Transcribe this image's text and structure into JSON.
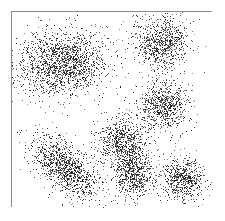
{
  "figure": {
    "title": "",
    "background_color": "#ffffff",
    "width": 225,
    "height": 221
  },
  "frame": {
    "name": "plot-border",
    "x": 11,
    "y": 11,
    "width": 201,
    "height": 196,
    "border_color": "#8a8a8a",
    "border_width": 1,
    "fill_color": "#ffffff"
  },
  "chart_data": {
    "type": "scatter",
    "title": "",
    "xlabel": "",
    "ylabel": "",
    "xlim": [
      0,
      225
    ],
    "ylim": [
      0,
      221
    ],
    "grid": false,
    "legend": null,
    "axis_ticks": false,
    "point_color": "#1a1a1a",
    "point_size": 1,
    "total_points": 6600,
    "clusters": [
      {
        "name": "top-left",
        "cx": 62,
        "cy": 62,
        "sx": 22,
        "sy": 17,
        "rotation_deg": -8,
        "n": 1700,
        "density": "very-high"
      },
      {
        "name": "top-right",
        "cx": 161,
        "cy": 42,
        "sx": 13,
        "sy": 13,
        "rotation_deg": 0,
        "n": 820,
        "density": "high"
      },
      {
        "name": "mid-right",
        "cx": 163,
        "cy": 105,
        "sx": 13,
        "sy": 13,
        "rotation_deg": 20,
        "n": 760,
        "density": "medium"
      },
      {
        "name": "bottom-left",
        "cx": 64,
        "cy": 166,
        "sx": 21,
        "sy": 11,
        "rotation_deg": 42,
        "n": 1150,
        "density": "high"
      },
      {
        "name": "bottom-center-upper",
        "cx": 122,
        "cy": 140,
        "sx": 12,
        "sy": 12,
        "rotation_deg": 35,
        "n": 700,
        "density": "medium"
      },
      {
        "name": "bottom-center-lower",
        "cx": 133,
        "cy": 173,
        "sx": 11,
        "sy": 11,
        "rotation_deg": 0,
        "n": 660,
        "density": "medium"
      },
      {
        "name": "bottom-right",
        "cx": 181,
        "cy": 178,
        "sx": 11,
        "sy": 11,
        "rotation_deg": 0,
        "n": 640,
        "density": "medium"
      }
    ]
  }
}
